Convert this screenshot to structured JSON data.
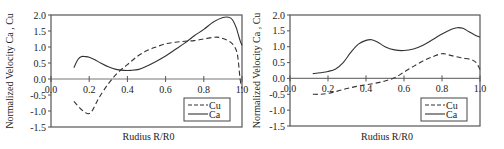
{
  "chart_data": [
    {
      "type": "line",
      "title": "",
      "xlabel": "Rudius  R/R0",
      "ylabel": "Normalized Velocity  Ca , Cu",
      "xlim": [
        0.0,
        1.0
      ],
      "ylim": [
        -1.5,
        2.0
      ],
      "xticks": [
        "0.0",
        "0.2",
        "0.4",
        "0.6",
        "0.8",
        "1.0"
      ],
      "xtick_values": [
        0.0,
        0.2,
        0.4,
        0.6,
        0.8,
        1.0
      ],
      "yticks": [
        "2.0",
        "1.5",
        "1.0",
        "0.5",
        "0.0",
        "-0.5",
        "-1.0",
        "-1.5"
      ],
      "ytick_values": [
        2.0,
        1.5,
        1.0,
        0.5,
        0.0,
        -0.5,
        -1.0,
        -1.5
      ],
      "grid": false,
      "legend": {
        "position": "bottom-right",
        "entries": [
          "Cu",
          "Ca"
        ]
      },
      "series": [
        {
          "name": "Cu",
          "style": "dashed",
          "x": [
            0.12,
            0.15,
            0.18,
            0.2,
            0.22,
            0.25,
            0.3,
            0.35,
            0.4,
            0.45,
            0.5,
            0.55,
            0.6,
            0.65,
            0.7,
            0.75,
            0.8,
            0.85,
            0.88,
            0.92,
            0.95,
            0.97,
            0.98,
            0.99,
            1.0
          ],
          "values": [
            -0.7,
            -0.9,
            -1.05,
            -1.08,
            -0.95,
            -0.6,
            -0.15,
            0.2,
            0.45,
            0.7,
            0.88,
            1.0,
            1.1,
            1.15,
            1.18,
            1.2,
            1.25,
            1.3,
            1.3,
            1.22,
            1.1,
            0.9,
            0.6,
            0.0,
            -0.3
          ]
        },
        {
          "name": "Ca",
          "style": "solid",
          "x": [
            0.12,
            0.14,
            0.16,
            0.18,
            0.2,
            0.23,
            0.26,
            0.3,
            0.34,
            0.38,
            0.42,
            0.46,
            0.5,
            0.55,
            0.6,
            0.65,
            0.7,
            0.75,
            0.8,
            0.85,
            0.9,
            0.93,
            0.95,
            0.97,
            0.98,
            0.99,
            1.0
          ],
          "values": [
            0.35,
            0.6,
            0.7,
            0.7,
            0.68,
            0.6,
            0.5,
            0.38,
            0.3,
            0.27,
            0.27,
            0.3,
            0.4,
            0.55,
            0.72,
            0.92,
            1.12,
            1.35,
            1.55,
            1.78,
            1.92,
            1.93,
            1.85,
            1.6,
            1.4,
            1.2,
            1.05
          ]
        }
      ]
    },
    {
      "type": "line",
      "title": "",
      "xlabel": "Rudius  R/R0",
      "ylabel": "Normalized Velocity  Ca , Cu",
      "xlim": [
        0.0,
        1.0
      ],
      "ylim": [
        -1.5,
        2.0
      ],
      "xticks": [
        "0.0",
        "0.2",
        "0.4",
        "0.6",
        "0.8",
        "1.0"
      ],
      "xtick_values": [
        0.0,
        0.2,
        0.4,
        0.6,
        0.8,
        1.0
      ],
      "yticks": [
        "2.0",
        "1.5",
        "1.0",
        "0.5",
        "0.0",
        "-0.5",
        "-1.0",
        "-1.5"
      ],
      "ytick_values": [
        2.0,
        1.5,
        1.0,
        0.5,
        0.0,
        -0.5,
        -1.0,
        -1.5
      ],
      "grid": false,
      "legend": {
        "position": "bottom-right",
        "entries": [
          "Cu",
          "Ca"
        ]
      },
      "series": [
        {
          "name": "Cu",
          "style": "dashed",
          "x": [
            0.12,
            0.16,
            0.2,
            0.25,
            0.3,
            0.35,
            0.4,
            0.45,
            0.5,
            0.55,
            0.6,
            0.65,
            0.7,
            0.75,
            0.8,
            0.85,
            0.9,
            0.95,
            0.98,
            1.0
          ],
          "values": [
            -0.5,
            -0.5,
            -0.47,
            -0.4,
            -0.32,
            -0.25,
            -0.2,
            -0.15,
            -0.08,
            0.02,
            0.2,
            0.38,
            0.55,
            0.68,
            0.78,
            0.72,
            0.65,
            0.6,
            0.5,
            0.28
          ]
        },
        {
          "name": "Ca",
          "style": "solid",
          "x": [
            0.12,
            0.16,
            0.2,
            0.24,
            0.28,
            0.32,
            0.36,
            0.4,
            0.43,
            0.46,
            0.5,
            0.55,
            0.6,
            0.65,
            0.7,
            0.75,
            0.8,
            0.85,
            0.88,
            0.91,
            0.94,
            0.97,
            1.0
          ],
          "values": [
            0.15,
            0.18,
            0.22,
            0.3,
            0.5,
            0.82,
            1.08,
            1.2,
            1.22,
            1.15,
            1.0,
            0.9,
            0.88,
            0.93,
            1.05,
            1.22,
            1.4,
            1.55,
            1.6,
            1.58,
            1.48,
            1.38,
            1.3
          ]
        }
      ]
    }
  ]
}
